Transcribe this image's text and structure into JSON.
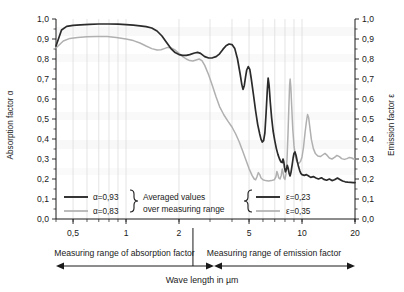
{
  "chart_data": {
    "type": "line",
    "title": "",
    "xlabel": "Wave length in µm",
    "ylabel_left": "Absorption factor α",
    "ylabel_right": "Emission factor ε",
    "xscale": "log",
    "xlim": [
      0.4,
      20
    ],
    "ylim": [
      0.0,
      1.0
    ],
    "grid": "vertical-log-minor",
    "xticks": [
      {
        "value": 0.5,
        "label": "0,5"
      },
      {
        "value": 1,
        "label": "1"
      },
      {
        "value": 2,
        "label": "2"
      },
      {
        "value": 5,
        "label": "5"
      },
      {
        "value": 10,
        "label": "10"
      },
      {
        "value": 20,
        "label": "20"
      }
    ],
    "yticks_left": [
      "0,0",
      "0,1",
      "0,2",
      "0,3",
      "0,4",
      "0,5",
      "0,6",
      "0,7",
      "0,8",
      "0,9",
      "1,0"
    ],
    "yticks_right": [
      "0,0",
      "0,1",
      "0,2",
      "0,3",
      "0,4",
      "0,5",
      "0,6",
      "0,7",
      "0,8",
      "0,9",
      "1,0"
    ],
    "ytick_values": [
      0.0,
      0.1,
      0.2,
      0.3,
      0.4,
      0.5,
      0.6,
      0.7,
      0.8,
      0.9,
      1.0
    ],
    "series": [
      {
        "name": "alpha-0.93",
        "color": "#2b2b2b",
        "style": "dark",
        "points": [
          [
            0.4,
            0.865
          ],
          [
            0.43,
            0.945
          ],
          [
            0.46,
            0.963
          ],
          [
            0.5,
            0.968
          ],
          [
            0.55,
            0.971
          ],
          [
            0.62,
            0.973
          ],
          [
            0.7,
            0.975
          ],
          [
            0.8,
            0.975
          ],
          [
            0.9,
            0.974
          ],
          [
            1.0,
            0.972
          ],
          [
            1.1,
            0.969
          ],
          [
            1.2,
            0.966
          ],
          [
            1.3,
            0.962
          ],
          [
            1.4,
            0.955
          ],
          [
            1.5,
            0.94
          ],
          [
            1.6,
            0.915
          ],
          [
            1.7,
            0.882
          ],
          [
            1.8,
            0.852
          ],
          [
            1.9,
            0.832
          ],
          [
            2.0,
            0.822
          ],
          [
            2.1,
            0.818
          ],
          [
            2.2,
            0.818
          ],
          [
            2.3,
            0.822
          ],
          [
            2.45,
            0.83
          ],
          [
            2.55,
            0.833
          ],
          [
            2.65,
            0.828
          ],
          [
            2.8,
            0.812
          ],
          [
            2.95,
            0.805
          ],
          [
            3.1,
            0.806
          ],
          [
            3.25,
            0.812
          ],
          [
            3.4,
            0.826
          ],
          [
            3.55,
            0.848
          ],
          [
            3.7,
            0.866
          ],
          [
            3.85,
            0.875
          ],
          [
            4.0,
            0.872
          ],
          [
            4.15,
            0.852
          ],
          [
            4.3,
            0.8
          ],
          [
            4.45,
            0.725
          ],
          [
            4.55,
            0.672
          ],
          [
            4.62,
            0.648
          ],
          [
            4.7,
            0.668
          ],
          [
            4.78,
            0.712
          ],
          [
            4.85,
            0.745
          ],
          [
            4.95,
            0.762
          ],
          [
            5.05,
            0.748
          ],
          [
            5.15,
            0.7
          ],
          [
            5.3,
            0.62
          ],
          [
            5.45,
            0.54
          ],
          [
            5.6,
            0.472
          ],
          [
            5.75,
            0.425
          ],
          [
            5.85,
            0.398
          ],
          [
            5.95,
            0.385
          ],
          [
            6.05,
            0.392
          ],
          [
            6.15,
            0.43
          ],
          [
            6.25,
            0.53
          ],
          [
            6.35,
            0.645
          ],
          [
            6.42,
            0.705
          ],
          [
            6.5,
            0.668
          ],
          [
            6.6,
            0.585
          ],
          [
            6.72,
            0.505
          ],
          [
            6.85,
            0.44
          ],
          [
            7.0,
            0.392
          ],
          [
            7.15,
            0.352
          ],
          [
            7.3,
            0.322
          ],
          [
            7.45,
            0.3
          ],
          [
            7.6,
            0.285
          ],
          [
            7.72,
            0.282
          ],
          [
            7.8,
            0.3
          ],
          [
            7.88,
            0.285
          ],
          [
            7.95,
            0.258
          ],
          [
            8.05,
            0.236
          ],
          [
            8.15,
            0.248
          ],
          [
            8.25,
            0.268
          ],
          [
            8.35,
            0.252
          ],
          [
            8.45,
            0.228
          ],
          [
            8.55,
            0.215
          ],
          [
            8.65,
            0.232
          ],
          [
            8.78,
            0.268
          ],
          [
            8.9,
            0.305
          ],
          [
            9.0,
            0.328
          ],
          [
            9.12,
            0.335
          ],
          [
            9.25,
            0.318
          ],
          [
            9.4,
            0.288
          ],
          [
            9.55,
            0.262
          ],
          [
            9.7,
            0.242
          ],
          [
            9.85,
            0.228
          ],
          [
            10.0,
            0.222
          ],
          [
            10.3,
            0.218
          ],
          [
            10.6,
            0.222
          ],
          [
            10.9,
            0.215
          ],
          [
            11.2,
            0.208
          ],
          [
            11.6,
            0.212
          ],
          [
            12.0,
            0.205
          ],
          [
            12.4,
            0.2
          ],
          [
            12.9,
            0.206
          ],
          [
            13.3,
            0.198
          ],
          [
            13.8,
            0.194
          ],
          [
            14.3,
            0.2
          ],
          [
            14.8,
            0.192
          ],
          [
            15.3,
            0.196
          ],
          [
            15.9,
            0.205
          ],
          [
            16.4,
            0.198
          ],
          [
            17.0,
            0.19
          ],
          [
            17.6,
            0.186
          ],
          [
            18.2,
            0.184
          ],
          [
            18.9,
            0.183
          ],
          [
            19.5,
            0.182
          ],
          [
            20.0,
            0.182
          ]
        ]
      },
      {
        "name": "alpha-0.83",
        "color": "#b0b0b0",
        "style": "light",
        "points": [
          [
            0.4,
            0.855
          ],
          [
            0.44,
            0.89
          ],
          [
            0.48,
            0.903
          ],
          [
            0.53,
            0.908
          ],
          [
            0.6,
            0.911
          ],
          [
            0.68,
            0.913
          ],
          [
            0.78,
            0.912
          ],
          [
            0.88,
            0.908
          ],
          [
            1.0,
            0.9
          ],
          [
            1.1,
            0.892
          ],
          [
            1.2,
            0.88
          ],
          [
            1.3,
            0.865
          ],
          [
            1.4,
            0.852
          ],
          [
            1.5,
            0.845
          ],
          [
            1.58,
            0.846
          ],
          [
            1.65,
            0.852
          ],
          [
            1.72,
            0.858
          ],
          [
            1.8,
            0.856
          ],
          [
            1.9,
            0.845
          ],
          [
            2.0,
            0.828
          ],
          [
            2.1,
            0.812
          ],
          [
            2.2,
            0.8
          ],
          [
            2.3,
            0.792
          ],
          [
            2.4,
            0.79
          ],
          [
            2.5,
            0.795
          ],
          [
            2.6,
            0.8
          ],
          [
            2.7,
            0.792
          ],
          [
            2.8,
            0.768
          ],
          [
            2.95,
            0.72
          ],
          [
            3.1,
            0.665
          ],
          [
            3.25,
            0.61
          ],
          [
            3.4,
            0.562
          ],
          [
            3.6,
            0.52
          ],
          [
            3.8,
            0.488
          ],
          [
            4.0,
            0.46
          ],
          [
            4.2,
            0.425
          ],
          [
            4.4,
            0.385
          ],
          [
            4.6,
            0.34
          ],
          [
            4.8,
            0.295
          ],
          [
            5.0,
            0.252
          ],
          [
            5.2,
            0.218
          ],
          [
            5.35,
            0.2
          ],
          [
            5.45,
            0.196
          ],
          [
            5.55,
            0.212
          ],
          [
            5.65,
            0.232
          ],
          [
            5.75,
            0.222
          ],
          [
            5.85,
            0.205
          ],
          [
            6.0,
            0.196
          ],
          [
            6.2,
            0.192
          ],
          [
            6.45,
            0.19
          ],
          [
            6.7,
            0.192
          ],
          [
            6.95,
            0.196
          ],
          [
            7.1,
            0.21
          ],
          [
            7.2,
            0.238
          ],
          [
            7.28,
            0.225
          ],
          [
            7.38,
            0.205
          ],
          [
            7.5,
            0.2
          ],
          [
            7.62,
            0.218
          ],
          [
            7.72,
            0.25
          ],
          [
            7.8,
            0.232
          ],
          [
            7.9,
            0.205
          ],
          [
            8.0,
            0.198
          ],
          [
            8.12,
            0.228
          ],
          [
            8.22,
            0.3
          ],
          [
            8.32,
            0.42
          ],
          [
            8.42,
            0.565
          ],
          [
            8.5,
            0.668
          ],
          [
            8.56,
            0.7
          ],
          [
            8.64,
            0.66
          ],
          [
            8.74,
            0.56
          ],
          [
            8.86,
            0.45
          ],
          [
            9.0,
            0.368
          ],
          [
            9.15,
            0.318
          ],
          [
            9.3,
            0.292
          ],
          [
            9.45,
            0.28
          ],
          [
            9.6,
            0.278
          ],
          [
            9.8,
            0.288
          ],
          [
            10.0,
            0.31
          ],
          [
            10.2,
            0.36
          ],
          [
            10.4,
            0.43
          ],
          [
            10.6,
            0.49
          ],
          [
            10.75,
            0.522
          ],
          [
            10.9,
            0.508
          ],
          [
            11.1,
            0.452
          ],
          [
            11.3,
            0.398
          ],
          [
            11.6,
            0.352
          ],
          [
            11.9,
            0.328
          ],
          [
            12.3,
            0.315
          ],
          [
            12.7,
            0.312
          ],
          [
            13.1,
            0.32
          ],
          [
            13.5,
            0.328
          ],
          [
            13.9,
            0.318
          ],
          [
            14.3,
            0.305
          ],
          [
            14.8,
            0.3
          ],
          [
            15.3,
            0.308
          ],
          [
            15.8,
            0.318
          ],
          [
            16.3,
            0.312
          ],
          [
            16.8,
            0.302
          ],
          [
            17.4,
            0.298
          ],
          [
            18.0,
            0.302
          ],
          [
            18.6,
            0.308
          ],
          [
            19.2,
            0.305
          ],
          [
            19.6,
            0.3
          ],
          [
            20.0,
            0.3
          ]
        ]
      }
    ],
    "legend_left": {
      "entries": [
        {
          "label": "α=0,93",
          "color": "#2b2b2b"
        },
        {
          "label": "α=0,83",
          "color": "#b0b0b0"
        }
      ],
      "annotation_line1": "Averaged values",
      "annotation_line2": "over measuring range"
    },
    "legend_right": {
      "entries": [
        {
          "label": "ε=0,23",
          "color": "#2b2b2b"
        },
        {
          "label": "ε=0,35",
          "color": "#b0b0b0"
        }
      ]
    },
    "ranges": [
      {
        "label": "Measuring range of absorption factor",
        "from": 0.4,
        "to": 2.4
      },
      {
        "label": "Measuring range of emission factor",
        "from": 2.4,
        "to": 20
      }
    ],
    "divider_value": 2.4
  }
}
